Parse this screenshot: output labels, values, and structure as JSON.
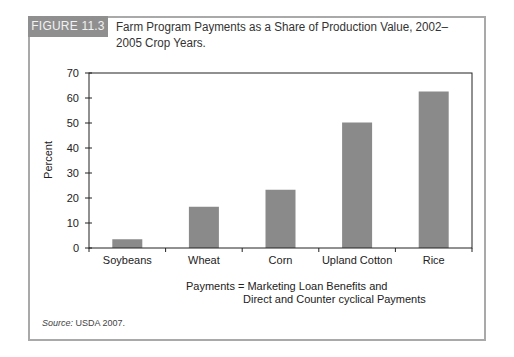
{
  "figure": {
    "badge": "FIGURE 11.3",
    "title": "Farm Program Payments as a Share of Production Value, 2002–2005 Crop Years.",
    "caption_line1": "Payments = Marketing Loan Benefits and",
    "caption_line2": "Direct and Counter cyclical Payments",
    "source_label": "Source:",
    "source_text": " USDA 2007."
  },
  "colors": {
    "bar": "#8a8a8a",
    "badge": "#8f8f8f",
    "frame": "#a9a9a9",
    "axis": "#222222"
  },
  "chart_data": {
    "type": "bar",
    "title": "Farm Program Payments as a Share of Production Value, 2002–2005 Crop Years.",
    "categories": [
      "Soybeans",
      "Wheat",
      "Corn",
      "Upland Cotton",
      "Rice"
    ],
    "values": [
      3.5,
      16.5,
      23.3,
      50.2,
      62.6
    ],
    "xlabel": "",
    "ylabel": "Percent",
    "ylim": [
      0,
      70
    ],
    "yticks": [
      0,
      10,
      20,
      30,
      40,
      50,
      60,
      70
    ],
    "grid": false,
    "legend": null,
    "annotations": [
      "Payments = Marketing Loan Benefits and Direct and Counter cyclical Payments"
    ]
  }
}
